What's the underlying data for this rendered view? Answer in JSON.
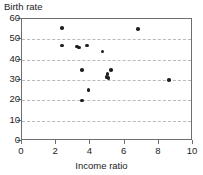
{
  "chart_data": {
    "type": "scatter",
    "title": "",
    "ylabel": "Birth rate",
    "xlabel": "Income ratio",
    "xlim": [
      0,
      10
    ],
    "ylim": [
      0,
      60
    ],
    "xticks": [
      0,
      2,
      4,
      6,
      8,
      10
    ],
    "yticks": [
      0,
      10,
      20,
      30,
      40,
      50,
      60
    ],
    "xtick_labels": [
      "0",
      "2",
      "4",
      "6",
      "8",
      "10"
    ],
    "ytick_labels": [
      "0",
      "10",
      "20",
      "30",
      "40",
      "50",
      "60"
    ],
    "grid": "horizontal-dashed",
    "legend": null,
    "marker": "filled-circle",
    "marker_color": "#1f1f1f",
    "points": [
      {
        "x": 2.35,
        "y": 55.5
      },
      {
        "x": 2.35,
        "y": 47.0
      },
      {
        "x": 3.2,
        "y": 46.5
      },
      {
        "x": 3.35,
        "y": 46.0
      },
      {
        "x": 3.8,
        "y": 47.0
      },
      {
        "x": 4.7,
        "y": 44.0
      },
      {
        "x": 3.5,
        "y": 35.0
      },
      {
        "x": 5.2,
        "y": 35.0
      },
      {
        "x": 5.0,
        "y": 33.0
      },
      {
        "x": 4.95,
        "y": 31.5
      },
      {
        "x": 5.05,
        "y": 31.0
      },
      {
        "x": 3.9,
        "y": 25.0
      },
      {
        "x": 3.5,
        "y": 20.0
      },
      {
        "x": 6.8,
        "y": 55.0
      },
      {
        "x": 8.6,
        "y": 30.0
      }
    ]
  },
  "axes": {
    "frame_color": "#6e6e6e",
    "grid_color": "#b9b9b9"
  }
}
